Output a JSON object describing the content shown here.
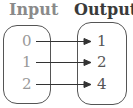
{
  "diagram": {
    "type": "mapping",
    "input_title": "Input",
    "output_title": "Output",
    "inputs": [
      "0",
      "1",
      "2"
    ],
    "outputs": [
      "1",
      "2",
      "4"
    ],
    "mappings": [
      {
        "from": "0",
        "to": "1"
      },
      {
        "from": "1",
        "to": "2"
      },
      {
        "from": "2",
        "to": "4"
      }
    ],
    "colors": {
      "input_title": "#8a8a8a",
      "output_title": "#3a3a3a",
      "input_values": "#999999",
      "output_values": "#555555",
      "lines": "#333333"
    }
  }
}
